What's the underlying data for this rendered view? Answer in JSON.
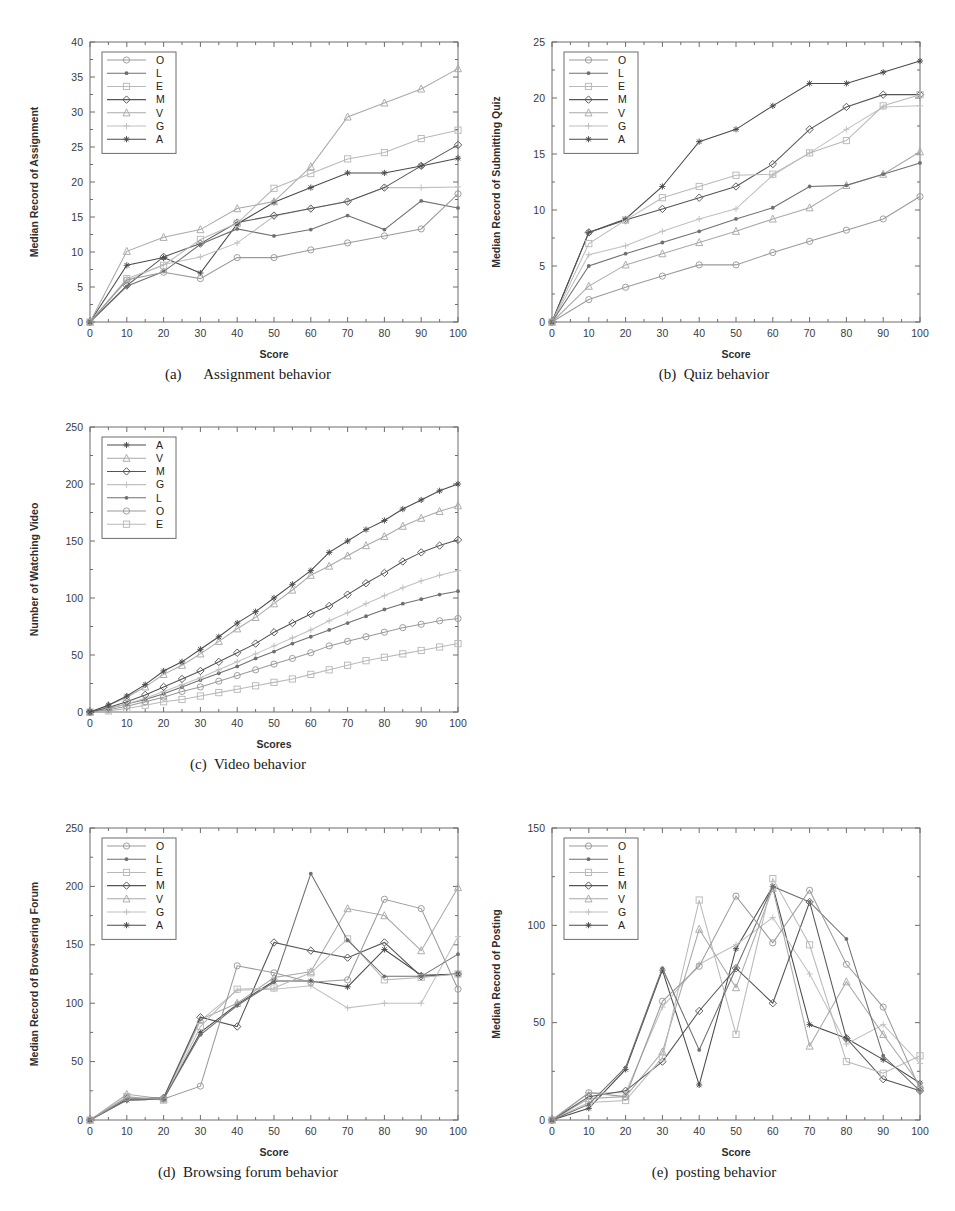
{
  "figure": {
    "panels": [
      "a",
      "b",
      "c",
      "d",
      "e"
    ]
  },
  "captions": {
    "a": "(a)      Assignment behavior",
    "b": "(b)  Quiz behavior",
    "c": "(c)  Video behavior",
    "d": "(d)  Browsing forum behavior",
    "e": "(e)  posting behavior"
  },
  "series_colors": {
    "O": "#9a9a9a",
    "L": "#6f6f6f",
    "E": "#b9b9b9",
    "M": "#555555",
    "V": "#a9a9a9",
    "G": "#c0c0c0",
    "A": "#4a4a4a"
  },
  "series_markers": {
    "O": "circle",
    "L": "dot",
    "E": "square",
    "M": "diamond",
    "V": "triangle",
    "G": "plus",
    "A": "star"
  },
  "chart_data": [
    {
      "id": "a",
      "type": "line",
      "title": "Assignment behavior",
      "xlabel": "Score",
      "ylabel": "Median Record of Assignment",
      "xlim": [
        0,
        100
      ],
      "ylim": [
        0,
        40
      ],
      "xticks": [
        0,
        10,
        20,
        30,
        40,
        50,
        60,
        70,
        80,
        90,
        100
      ],
      "yticks": [
        0,
        5,
        10,
        15,
        20,
        25,
        30,
        35,
        40
      ],
      "grid": false,
      "legend_position": "top-left",
      "legend": [
        "O",
        "L",
        "E",
        "M",
        "V",
        "G",
        "A"
      ],
      "x": [
        0,
        10,
        20,
        30,
        40,
        50,
        60,
        70,
        80,
        90,
        100
      ],
      "series": [
        {
          "name": "O",
          "values": [
            0,
            6.0,
            7.1,
            6.2,
            9.2,
            9.2,
            10.3,
            11.3,
            12.3,
            13.3,
            18.3
          ]
        },
        {
          "name": "L",
          "values": [
            0,
            5.1,
            7.2,
            11.1,
            13.3,
            12.3,
            13.2,
            15.2,
            13.2,
            17.3,
            16.3
          ]
        },
        {
          "name": "E",
          "values": [
            0,
            6.2,
            8.1,
            11.8,
            14.1,
            19.1,
            21.2,
            23.3,
            24.2,
            26.2,
            27.4
          ]
        },
        {
          "name": "M",
          "values": [
            0,
            5.2,
            9.3,
            11.2,
            14.2,
            15.2,
            16.2,
            17.2,
            19.2,
            22.3,
            25.3
          ]
        },
        {
          "name": "V",
          "values": [
            0,
            10.1,
            12.1,
            13.2,
            16.2,
            17.2,
            22.2,
            29.3,
            31.3,
            33.3,
            36.2
          ]
        },
        {
          "name": "G",
          "values": [
            0,
            5.9,
            8.2,
            9.3,
            11.3,
            15.1,
            16.2,
            17.2,
            19.2,
            19.2,
            19.3
          ]
        },
        {
          "name": "A",
          "values": [
            0,
            8.1,
            9.2,
            7.0,
            14.0,
            17.1,
            19.2,
            21.3,
            21.3,
            22.3,
            23.4
          ]
        }
      ]
    },
    {
      "id": "b",
      "type": "line",
      "title": "Quiz behavior",
      "xlabel": "Score",
      "ylabel": "Median Record of Submitting Quiz",
      "xlim": [
        0,
        100
      ],
      "ylim": [
        0,
        25
      ],
      "xticks": [
        0,
        10,
        20,
        30,
        40,
        50,
        60,
        70,
        80,
        90,
        100
      ],
      "yticks": [
        0,
        5,
        10,
        15,
        20,
        25
      ],
      "grid": false,
      "legend_position": "top-left",
      "legend": [
        "O",
        "L",
        "E",
        "M",
        "V",
        "G",
        "A"
      ],
      "x": [
        0,
        10,
        20,
        30,
        40,
        50,
        60,
        70,
        80,
        90,
        100
      ],
      "series": [
        {
          "name": "O",
          "values": [
            0,
            2.0,
            3.1,
            4.1,
            5.1,
            5.1,
            6.2,
            7.2,
            8.2,
            9.2,
            11.2
          ]
        },
        {
          "name": "L",
          "values": [
            0,
            5.0,
            6.1,
            7.1,
            8.1,
            9.2,
            10.2,
            12.1,
            12.2,
            13.2,
            14.2
          ]
        },
        {
          "name": "E",
          "values": [
            0,
            7.0,
            9.1,
            11.1,
            12.1,
            13.1,
            13.2,
            15.1,
            16.2,
            19.3,
            20.3
          ]
        },
        {
          "name": "M",
          "values": [
            0,
            8.0,
            9.1,
            10.1,
            11.1,
            12.1,
            14.1,
            17.2,
            19.2,
            20.3,
            20.3
          ]
        },
        {
          "name": "V",
          "values": [
            0,
            3.2,
            5.1,
            6.1,
            7.1,
            8.1,
            9.2,
            10.2,
            12.2,
            13.2,
            15.2
          ]
        },
        {
          "name": "G",
          "values": [
            0,
            6.0,
            6.8,
            8.1,
            9.2,
            10.1,
            13.1,
            15.1,
            17.2,
            19.2,
            19.3
          ]
        },
        {
          "name": "A",
          "values": [
            0,
            8.0,
            9.2,
            12.1,
            16.1,
            17.2,
            19.3,
            21.3,
            21.3,
            22.3,
            23.3
          ]
        }
      ]
    },
    {
      "id": "c",
      "type": "line",
      "title": "Video behavior",
      "xlabel": "Scores",
      "ylabel": "Number of Watching Video",
      "xlim": [
        0,
        100
      ],
      "ylim": [
        0,
        250
      ],
      "xticks": [
        0,
        10,
        20,
        30,
        40,
        50,
        60,
        70,
        80,
        90,
        100
      ],
      "yticks": [
        0,
        50,
        100,
        150,
        200,
        250
      ],
      "grid": false,
      "legend_position": "top-left",
      "legend": [
        "A",
        "V",
        "M",
        "G",
        "L",
        "O",
        "E"
      ],
      "x": [
        0,
        5,
        10,
        15,
        20,
        25,
        30,
        35,
        40,
        45,
        50,
        55,
        60,
        65,
        70,
        75,
        80,
        85,
        90,
        95,
        100
      ],
      "series": [
        {
          "name": "A",
          "values": [
            0,
            6,
            14,
            24,
            36,
            44,
            55,
            66,
            78,
            88,
            100,
            112,
            124,
            140,
            150,
            160,
            168,
            178,
            186,
            194,
            200
          ]
        },
        {
          "name": "V",
          "values": [
            0,
            6,
            13,
            22,
            33,
            41,
            51,
            62,
            73,
            83,
            95,
            107,
            120,
            128,
            137,
            146,
            154,
            163,
            170,
            176,
            181
          ]
        },
        {
          "name": "M",
          "values": [
            0,
            4,
            9,
            15,
            22,
            29,
            36,
            44,
            52,
            60,
            70,
            78,
            86,
            93,
            103,
            113,
            122,
            132,
            140,
            146,
            151
          ]
        },
        {
          "name": "G",
          "values": [
            0,
            3,
            7,
            12,
            18,
            24,
            30,
            37,
            44,
            51,
            58,
            65,
            72,
            80,
            87,
            95,
            102,
            109,
            115,
            120,
            124
          ]
        },
        {
          "name": "L",
          "values": [
            0,
            3,
            7,
            11,
            16,
            22,
            28,
            34,
            40,
            47,
            53,
            60,
            66,
            72,
            78,
            84,
            90,
            95,
            99,
            103,
            106
          ]
        },
        {
          "name": "O",
          "values": [
            0,
            2,
            5,
            9,
            13,
            18,
            22,
            27,
            32,
            37,
            42,
            47,
            52,
            58,
            62,
            66,
            70,
            74,
            77,
            80,
            82
          ]
        },
        {
          "name": "E",
          "values": [
            0,
            1,
            3,
            6,
            9,
            11,
            14,
            17,
            20,
            23,
            26,
            29,
            33,
            37,
            41,
            45,
            48,
            51,
            54,
            57,
            60
          ]
        }
      ]
    },
    {
      "id": "d",
      "type": "line",
      "title": "Browsing forum behavior",
      "xlabel": "Score",
      "ylabel": "Median Record of Browsering Forum",
      "xlim": [
        0,
        100
      ],
      "ylim": [
        0,
        250
      ],
      "xticks": [
        0,
        10,
        20,
        30,
        40,
        50,
        60,
        70,
        80,
        90,
        100
      ],
      "yticks": [
        0,
        50,
        100,
        150,
        200,
        250
      ],
      "grid": false,
      "legend_position": "top-left",
      "legend": [
        "O",
        "L",
        "E",
        "M",
        "V",
        "G",
        "A"
      ],
      "x": [
        0,
        10,
        20,
        30,
        40,
        50,
        60,
        70,
        80,
        90,
        100
      ],
      "series": [
        {
          "name": "O",
          "values": [
            0,
            19,
            18,
            29,
            132,
            126,
            118,
            120,
            189,
            181,
            112
          ]
        },
        {
          "name": "L",
          "values": [
            0,
            17,
            18,
            73,
            98,
            118,
            211,
            154,
            123,
            123,
            142
          ]
        },
        {
          "name": "E",
          "values": [
            0,
            20,
            17,
            80,
            112,
            113,
            126,
            155,
            120,
            122,
            125
          ]
        },
        {
          "name": "M",
          "values": [
            0,
            18,
            19,
            88,
            80,
            152,
            145,
            139,
            152,
            123,
            125
          ]
        },
        {
          "name": "V",
          "values": [
            0,
            22,
            18,
            86,
            100,
            122,
            127,
            181,
            175,
            145,
            199
          ]
        },
        {
          "name": "G",
          "values": [
            0,
            17,
            18,
            85,
            111,
            112,
            115,
            96,
            100,
            100,
            157
          ]
        },
        {
          "name": "A",
          "values": [
            0,
            17,
            18,
            75,
            99,
            119,
            119,
            114,
            146,
            124,
            125
          ]
        }
      ]
    },
    {
      "id": "e",
      "type": "line",
      "title": "posting behavior",
      "xlabel": "Score",
      "ylabel": "Median Record of Posting",
      "xlim": [
        0,
        100
      ],
      "ylim": [
        0,
        150
      ],
      "xticks": [
        0,
        10,
        20,
        30,
        40,
        50,
        60,
        70,
        80,
        90,
        100
      ],
      "yticks": [
        0,
        50,
        100,
        150
      ],
      "grid": false,
      "legend_position": "top-left",
      "legend": [
        "O",
        "L",
        "E",
        "M",
        "V",
        "G",
        "A"
      ],
      "x": [
        0,
        10,
        20,
        30,
        40,
        50,
        60,
        70,
        80,
        90,
        100
      ],
      "series": [
        {
          "name": "O",
          "values": [
            0,
            14,
            12,
            61,
            79,
            115,
            91,
            118,
            80,
            58,
            16
          ]
        },
        {
          "name": "L",
          "values": [
            0,
            8,
            27,
            78,
            36,
            78,
            120,
            112,
            93,
            33,
            15
          ]
        },
        {
          "name": "E",
          "values": [
            0,
            9,
            10,
            32,
            113,
            44,
            124,
            90,
            30,
            24,
            33
          ]
        },
        {
          "name": "M",
          "values": [
            0,
            12,
            15,
            30,
            56,
            78,
            60,
            112,
            42,
            21,
            15
          ]
        },
        {
          "name": "V",
          "values": [
            0,
            11,
            12,
            35,
            98,
            68,
            119,
            38,
            71,
            44,
            18
          ]
        },
        {
          "name": "G",
          "values": [
            0,
            14,
            14,
            58,
            80,
            90,
            104,
            75,
            39,
            49,
            29
          ]
        },
        {
          "name": "A",
          "values": [
            0,
            6,
            26,
            77,
            18,
            88,
            120,
            49,
            42,
            31,
            19
          ]
        }
      ]
    }
  ]
}
